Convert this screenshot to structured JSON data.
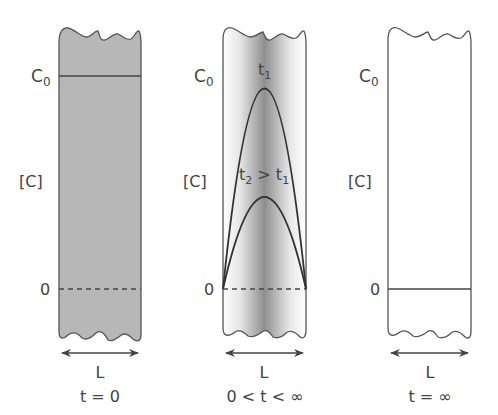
{
  "figure": {
    "type": "diffusion-concentration-profiles",
    "panels": [
      {
        "id": "initial",
        "y_label": "[C]",
        "y_top_label": "C",
        "y_top_sub": "0",
        "y_zero_label": "0",
        "width_label": "L",
        "time_label": "t = 0",
        "fill": "#b9b9b9"
      },
      {
        "id": "transient",
        "y_label": "[C]",
        "y_top_label": "C",
        "y_top_sub": "0",
        "y_zero_label": "0",
        "width_label": "L",
        "time_label": "0 < t < ∞",
        "curve1_label": "t",
        "curve1_sub": "1",
        "curve2_label_a": "t",
        "curve2_sub_a": "2",
        "curve2_op": " > ",
        "curve2_label_b": "t",
        "curve2_sub_b": "1"
      },
      {
        "id": "equilibrium",
        "y_label": "[C]",
        "y_top_label": "C",
        "y_top_sub": "0",
        "y_zero_label": "0",
        "width_label": "L",
        "time_label": "t = ∞"
      }
    ],
    "colors": {
      "outline": "#555555",
      "line": "#444444",
      "text": "#444444",
      "shade_dark": "#8a8a8a",
      "shade_light": "#ffffff"
    }
  }
}
